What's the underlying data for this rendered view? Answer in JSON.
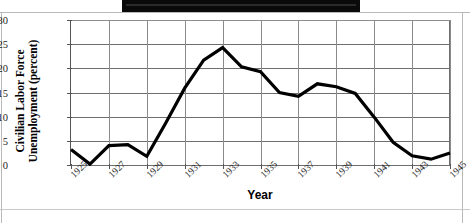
{
  "page": {
    "redaction_bar": "redacted-black-bar"
  },
  "chart_data": {
    "type": "line",
    "title": "",
    "xlabel": "Year",
    "ylabel": "Civilian Labor Force Unemployment (percent)",
    "ylabel_line1": "Civilian Labor Force",
    "ylabel_line2": "Unemployment (percent)",
    "xlim": [
      1925,
      1945
    ],
    "ylim": [
      0,
      30
    ],
    "ytick_step": 5,
    "xtick_step": 2,
    "grid": true,
    "legend": "none",
    "yticks": [
      "0",
      "5",
      "10",
      "15",
      "20",
      "25",
      "30"
    ],
    "xticks": [
      "1925",
      "1927",
      "1929",
      "1931",
      "1933",
      "1935",
      "1937",
      "1939",
      "1941",
      "1943",
      "1945"
    ],
    "x": [
      1925,
      1926,
      1927,
      1928,
      1929,
      1930,
      1931,
      1932,
      1933,
      1934,
      1935,
      1936,
      1937,
      1938,
      1939,
      1940,
      1941,
      1942,
      1943,
      1944,
      1945
    ],
    "values": [
      3.2,
      0.2,
      4.0,
      4.2,
      1.8,
      8.7,
      15.9,
      21.7,
      24.3,
      20.3,
      19.3,
      15.0,
      14.2,
      16.8,
      16.2,
      14.8,
      9.9,
      4.7,
      1.9,
      1.2,
      2.5
    ],
    "series": [
      {
        "name": "Civilian Labor Force Unemployment",
        "color": "#000000",
        "values": [
          3.2,
          0.2,
          4.0,
          4.2,
          1.8,
          8.7,
          15.9,
          21.7,
          24.3,
          20.3,
          19.3,
          15.0,
          14.2,
          16.8,
          16.2,
          14.8,
          9.9,
          4.7,
          1.9,
          1.2,
          2.5
        ]
      }
    ]
  }
}
